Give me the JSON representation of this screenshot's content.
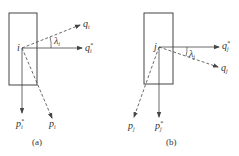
{
  "panels": [
    {
      "id": "a",
      "caption": "(a)",
      "point": "i",
      "angle": {
        "sym": "λ",
        "sub": "i"
      },
      "vectors": {
        "q": {
          "base": "q",
          "sub": "i",
          "sup": ""
        },
        "q_star": {
          "base": "q",
          "sub": "i",
          "sup": "*"
        },
        "p_star": {
          "base": "p",
          "sub": "i",
          "sup": "*"
        },
        "p": {
          "base": "p",
          "sub": "i",
          "sup": ""
        }
      }
    },
    {
      "id": "b",
      "caption": "(b)",
      "point": "j",
      "angle": {
        "sym": "λ",
        "sub": "j"
      },
      "vectors": {
        "q_star": {
          "base": "q",
          "sub": "j",
          "sup": "*"
        },
        "q": {
          "base": "q",
          "sub": "j",
          "sup": ""
        },
        "p": {
          "base": "p",
          "sub": "j",
          "sup": ""
        },
        "p_star": {
          "base": "p",
          "sub": "j",
          "sup": "*"
        }
      }
    }
  ],
  "colors": {
    "line": "#444444",
    "text": "#333333"
  }
}
